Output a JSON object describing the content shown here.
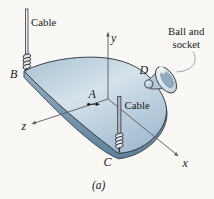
{
  "figure": {
    "caption": "(a)",
    "supports": {
      "cable_b_label": "Cable",
      "cable_c_label": "Cable",
      "ball_socket_label_line1": "Ball and",
      "ball_socket_label_line2": "socket"
    },
    "points": {
      "a": "A",
      "b": "B",
      "c": "C",
      "d": "D"
    },
    "axes": {
      "x": "x",
      "y": "y",
      "z": "z"
    },
    "colors": {
      "plate_top_light": "#d6e2ea",
      "plate_top": "#bcd0de",
      "plate_side": "#6d90aa",
      "outline": "#3a4049",
      "axis_line": "#55595f",
      "cable_fill": "#b4bcc3",
      "cable_b_fill": "#efefef",
      "coil_fill": "#e3e6e9",
      "leader": "#a0a5aa",
      "background": "#f9f8f4",
      "text": "#1a1a1c"
    }
  }
}
